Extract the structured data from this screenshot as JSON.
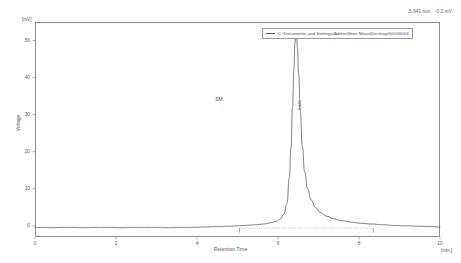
{
  "status": {
    "retention_readout": "5.941 min",
    "signal_readout": "-0.2 mV"
  },
  "legend": {
    "marker": "line-swatch",
    "label": "C:\\Documents and Settings\\Admin\\Start Menu\\Desktop\\00000004"
  },
  "annotations": {
    "sample_label": "SM",
    "peak_label": "6.449"
  },
  "chart_data": {
    "type": "line",
    "title": "",
    "xlabel": "Retention Time",
    "ylabel": "Voltage",
    "xunit": "[min.]",
    "yunit": "[mV]",
    "xlim": [
      0,
      10
    ],
    "ylim": [
      -3,
      55
    ],
    "grid": false,
    "legend_position": "top-right",
    "xticks": [
      0,
      2,
      4,
      6,
      8,
      10
    ],
    "yticks": [
      0,
      10,
      20,
      30,
      40,
      50
    ],
    "series": [
      {
        "name": "C:\\Documents and Settings\\Admin\\Start Menu\\Desktop\\00000004",
        "color": "#555555",
        "x": [
          0.0,
          0.2,
          0.45,
          0.7,
          0.95,
          1.2,
          1.5,
          1.8,
          2.1,
          2.4,
          2.7,
          3.0,
          3.3,
          3.6,
          3.9,
          4.2,
          4.5,
          4.8,
          5.0,
          5.15,
          5.3,
          5.45,
          5.55,
          5.65,
          5.75,
          5.85,
          5.95,
          6.05,
          6.15,
          6.22,
          6.28,
          6.32,
          6.36,
          6.39,
          6.42,
          6.44,
          6.449,
          6.46,
          6.48,
          6.51,
          6.55,
          6.6,
          6.66,
          6.73,
          6.82,
          6.92,
          7.05,
          7.2,
          7.38,
          7.58,
          7.8,
          8.05,
          8.3,
          8.6,
          8.9,
          9.2,
          9.5,
          9.75,
          10.0
        ],
        "y": [
          -0.4,
          -0.4,
          -0.5,
          -0.4,
          -0.4,
          -0.5,
          -0.4,
          -0.4,
          -0.5,
          -0.4,
          -0.4,
          -0.4,
          -0.5,
          -0.4,
          -0.4,
          -0.3,
          -0.2,
          -0.1,
          0.0,
          0.1,
          0.2,
          0.3,
          0.4,
          0.5,
          0.7,
          0.9,
          1.2,
          1.8,
          3.2,
          6.0,
          13.0,
          21.0,
          32.0,
          42.0,
          49.5,
          51.6,
          52.0,
          51.4,
          48.0,
          41.0,
          31.0,
          21.5,
          14.5,
          10.0,
          7.0,
          5.0,
          3.6,
          2.6,
          1.9,
          1.4,
          1.0,
          0.7,
          0.5,
          0.3,
          0.1,
          0.0,
          -0.1,
          -0.2,
          -0.3
        ]
      }
    ],
    "baseline": {
      "name": "integration-baseline",
      "style": "dotted",
      "color": "#8a8a8a",
      "x_start": 5.05,
      "x_end": 8.35,
      "y": -0.6
    },
    "integration_marks": [
      {
        "x": 5.05,
        "name": "peak-start-marker"
      },
      {
        "x": 8.35,
        "name": "peak-end-marker"
      }
    ],
    "peak": {
      "retention_time": 6.449,
      "height": 52.0,
      "label": "6.449"
    }
  }
}
